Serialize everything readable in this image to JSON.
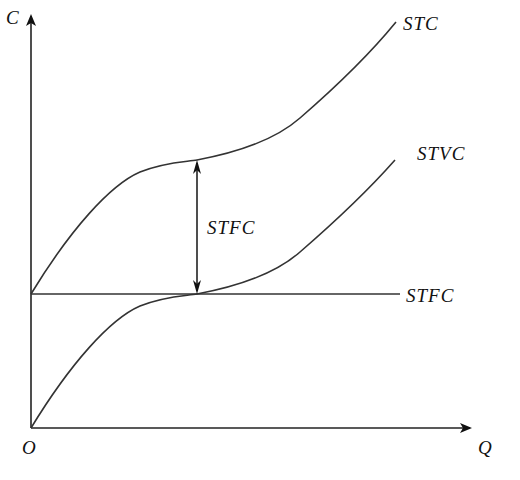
{
  "diagram": {
    "title": "",
    "axes": {
      "y_label": "C",
      "x_label": "Q",
      "origin_label": "O"
    },
    "curves": [
      {
        "id": "stc",
        "label": "STC",
        "description": "Short-run total cost; starts at fixed-cost level on the vertical axis, concave then convex"
      },
      {
        "id": "stvc",
        "label": "STVC",
        "description": "Short-run total variable cost; starts at origin, concave then convex"
      },
      {
        "id": "stfc",
        "label": "STFC",
        "description": "Short-run total fixed cost; horizontal line"
      }
    ],
    "annotation": {
      "label": "STFC",
      "description": "Vertical double-headed arrow showing constant gap between STC and STVC equals STFC"
    }
  }
}
